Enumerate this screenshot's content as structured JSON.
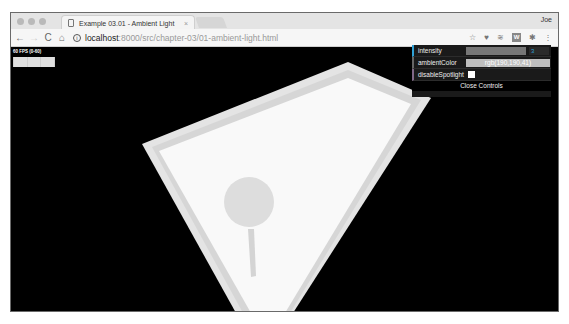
{
  "browser": {
    "tab_title": "Example 03.01 - Ambient Light",
    "tab_close": "×",
    "profile_name": "Joe",
    "url_host": "localhost",
    "url_path": ":8000/src/chapter-03/01-ambient-light.html",
    "nav": {
      "back": "←",
      "forward": "→",
      "reload": "C",
      "home": "⌂"
    },
    "extensions": [
      "star-icon",
      "twitter-icon",
      "buffer-icon",
      "w-extension-icon",
      "extension-icon",
      "menu-icon"
    ],
    "ext_labels": {
      "star": "☆",
      "twitter": "♥",
      "buffer": "≋",
      "w": "W",
      "extension": "✱",
      "menu": "⋮"
    },
    "info_icon": "i"
  },
  "stats": {
    "fps_label": "60 FPS (0-60)"
  },
  "controls": {
    "rows": [
      {
        "label": "intensity",
        "type": "slider",
        "value": "3"
      },
      {
        "label": "ambientColor",
        "type": "color",
        "value": "rgb(190,190,41)"
      },
      {
        "label": "disableSpotlight",
        "type": "checkbox",
        "checked": false
      }
    ],
    "close_label": "Close Controls"
  },
  "colors": {
    "background": "#000000",
    "plane": "#f8f8f8",
    "plane_border": "#e2e2e2",
    "object": "#dcdcdc",
    "slider_accent": "#2fa1d6"
  }
}
